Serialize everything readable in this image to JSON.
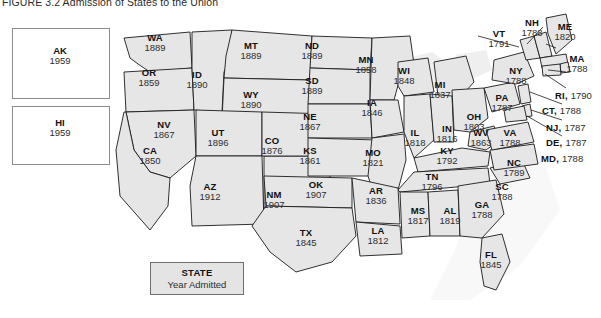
{
  "figure": {
    "title": "FIGURE 3.2 Admission of States to the Union"
  },
  "legend": {
    "title": "STATE",
    "subtitle": "Year Admitted"
  },
  "insets": [
    {
      "abbr": "AK",
      "year": "1959"
    },
    {
      "abbr": "HI",
      "year": "1959"
    }
  ],
  "states": [
    {
      "abbr": "WA",
      "year": "1889"
    },
    {
      "abbr": "OR",
      "year": "1859"
    },
    {
      "abbr": "ID",
      "year": "1890"
    },
    {
      "abbr": "MT",
      "year": "1889"
    },
    {
      "abbr": "ND",
      "year": "1889"
    },
    {
      "abbr": "MN",
      "year": "1858"
    },
    {
      "abbr": "SD",
      "year": "1889"
    },
    {
      "abbr": "WI",
      "year": "1848"
    },
    {
      "abbr": "MI",
      "year": "1837"
    },
    {
      "abbr": "WY",
      "year": "1890"
    },
    {
      "abbr": "NV",
      "year": "1867"
    },
    {
      "abbr": "NE",
      "year": "1867"
    },
    {
      "abbr": "IA",
      "year": "1846"
    },
    {
      "abbr": "UT",
      "year": "1896"
    },
    {
      "abbr": "CO",
      "year": "1876"
    },
    {
      "abbr": "IL",
      "year": "1818"
    },
    {
      "abbr": "IN",
      "year": "1816"
    },
    {
      "abbr": "OH",
      "year": "1803"
    },
    {
      "abbr": "CA",
      "year": "1850"
    },
    {
      "abbr": "KS",
      "year": "1861"
    },
    {
      "abbr": "MO",
      "year": "1821"
    },
    {
      "abbr": "WV",
      "year": "1863"
    },
    {
      "abbr": "KY",
      "year": "1792"
    },
    {
      "abbr": "AZ",
      "year": "1912"
    },
    {
      "abbr": "NM",
      "year": "1907"
    },
    {
      "abbr": "OK",
      "year": "1907"
    },
    {
      "abbr": "AR",
      "year": "1836"
    },
    {
      "abbr": "TN",
      "year": "1796"
    },
    {
      "abbr": "NC",
      "year": "1789"
    },
    {
      "abbr": "SC",
      "year": "1788"
    },
    {
      "abbr": "MS",
      "year": "1817"
    },
    {
      "abbr": "AL",
      "year": "1819"
    },
    {
      "abbr": "GA",
      "year": "1788"
    },
    {
      "abbr": "LA",
      "year": "1812"
    },
    {
      "abbr": "TX",
      "year": "1845"
    },
    {
      "abbr": "FL",
      "year": "1845"
    },
    {
      "abbr": "VA",
      "year": "1788"
    },
    {
      "abbr": "NY",
      "year": "1788"
    },
    {
      "abbr": "PA",
      "year": "1787"
    },
    {
      "abbr": "VT",
      "year": "1791"
    },
    {
      "abbr": "NH",
      "year": "1788"
    },
    {
      "abbr": "ME",
      "year": "1820"
    },
    {
      "abbr": "MA",
      "year": "1788"
    },
    {
      "abbr": "RI",
      "year": "1790"
    },
    {
      "abbr": "CT",
      "year": "1788"
    },
    {
      "abbr": "NJ",
      "year": "1787"
    },
    {
      "abbr": "DE",
      "year": "1787"
    },
    {
      "abbr": "MD",
      "year": "1788"
    }
  ],
  "colors": {
    "land_fill": "#e6e6e6",
    "border_stroke": "#1a1a1a",
    "ocean": "#ffffff",
    "label_text": "#1b1b1b",
    "legend_fill": "#e4e4e4"
  }
}
